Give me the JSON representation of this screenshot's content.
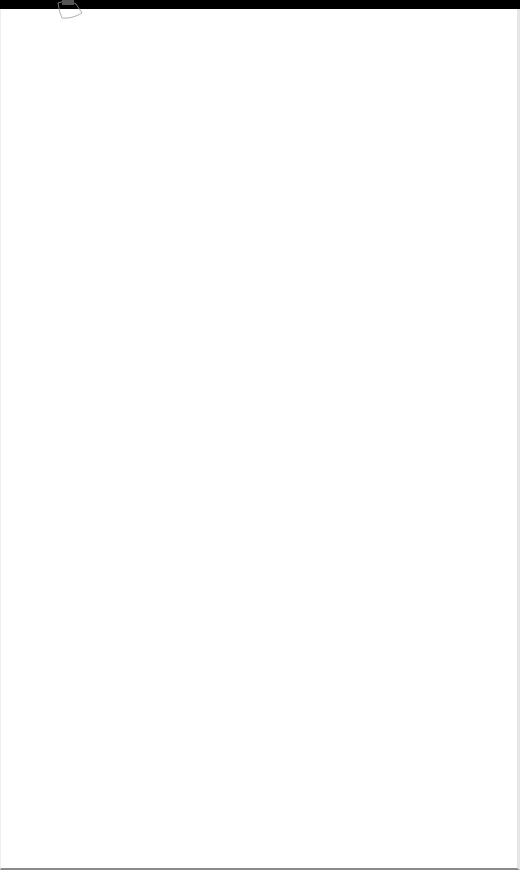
{
  "window": {
    "title": "",
    "background": "#ffffff",
    "topbar_color": "#000000"
  },
  "icons": {
    "logo": "sketch-shape-icon"
  }
}
